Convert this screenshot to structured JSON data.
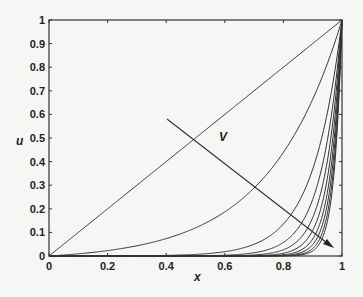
{
  "chart_data": {
    "type": "line",
    "title": "",
    "xlabel": "x",
    "ylabel": "u",
    "xlim": [
      0,
      1
    ],
    "ylim": [
      0,
      1
    ],
    "grid": false,
    "legend": null,
    "x_ticks": [
      "0",
      "0.2",
      "0.4",
      "0.6",
      "0.8",
      "1"
    ],
    "y_ticks": [
      "0",
      "0.1",
      "0.2",
      "0.3",
      "0.4",
      "0.5",
      "0.6",
      "0.7",
      "0.8",
      "0.9",
      "1"
    ],
    "annotations": [
      {
        "text": "V",
        "x": 0.59,
        "y": 0.5,
        "note": "arrow from (0.40, 0.58) to (0.97, 0.04) indicating increasing V"
      }
    ],
    "series_model": "u(x) = (exp(x/eps) - 1) / (exp(1/eps) - 1); eps = null means linear u = x",
    "series": [
      {
        "name": "curve-1",
        "eps": null,
        "x": [
          0,
          0.2,
          0.4,
          0.6,
          0.8,
          1
        ],
        "values": [
          0,
          0.2,
          0.4,
          0.6,
          0.8,
          1
        ]
      },
      {
        "name": "curve-2",
        "eps": 0.25,
        "x": [
          0,
          0.2,
          0.4,
          0.6,
          0.8,
          1
        ],
        "values": [
          0,
          0.021,
          0.074,
          0.187,
          0.44,
          1
        ]
      },
      {
        "name": "curve-3",
        "eps": 0.1,
        "x": [
          0,
          0.2,
          0.4,
          0.6,
          0.8,
          0.9,
          1
        ],
        "values": [
          0,
          0.0003,
          0.0025,
          0.018,
          0.135,
          0.368,
          1
        ]
      },
      {
        "name": "curve-4",
        "eps": 0.07
      },
      {
        "name": "curve-5",
        "eps": 0.055
      },
      {
        "name": "curve-6",
        "eps": 0.045
      },
      {
        "name": "curve-7",
        "eps": 0.038
      },
      {
        "name": "curve-8",
        "eps": 0.033
      },
      {
        "name": "curve-9",
        "eps": 0.029
      },
      {
        "name": "curve-10",
        "eps": 0.026
      }
    ]
  },
  "labels": {
    "xlabel": "x",
    "ylabel": "u",
    "annotation": "V"
  },
  "colors": {
    "line": "#333333",
    "axis": "#333333",
    "background": "#f6f6f4"
  }
}
